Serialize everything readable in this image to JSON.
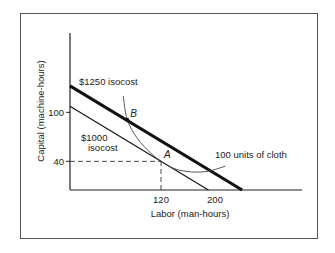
{
  "chart_data": {
    "type": "line",
    "title": "",
    "xlabel": "Labor (man-hours)",
    "ylabel": "Capital (machine-hours)",
    "x_ticks": [
      {
        "value": 120,
        "label": "120"
      },
      {
        "value": 200,
        "label": "200"
      }
    ],
    "y_ticks": [
      {
        "value": 40,
        "label": "40"
      },
      {
        "value": 100,
        "label": "100"
      }
    ],
    "xlim": [
      0,
      280
    ],
    "ylim": [
      0,
      160
    ],
    "grid": false,
    "series": [
      {
        "name": "$1000 isocost",
        "label_lines": [
          "$1000",
          "isocost"
        ],
        "style": "thin",
        "points": [
          [
            0,
            100
          ],
          [
            200,
            0
          ]
        ]
      },
      {
        "name": "$1250 isocost",
        "label_lines": [
          "$1250 isocost"
        ],
        "style": "thick",
        "points": [
          [
            0,
            125
          ],
          [
            250,
            0
          ]
        ]
      },
      {
        "name": "100 units of cloth",
        "label_lines": [
          "100 units of cloth"
        ],
        "style": "curve",
        "points": [
          [
            64,
            120
          ],
          [
            70,
            91
          ],
          [
            85,
            68
          ],
          [
            105,
            50
          ],
          [
            120,
            40
          ],
          [
            140,
            31
          ],
          [
            165,
            27
          ],
          [
            190,
            28
          ],
          [
            215,
            34
          ]
        ]
      }
    ],
    "annotations": [
      {
        "label": "A",
        "x": 120,
        "y": 40,
        "marker": false
      },
      {
        "label": "B",
        "x": 70,
        "y": 91,
        "marker": true
      }
    ],
    "guides": [
      {
        "from": [
          0,
          40
        ],
        "to": [
          120,
          40
        ],
        "style": "dashed"
      },
      {
        "from": [
          120,
          0
        ],
        "to": [
          120,
          40
        ],
        "style": "dashed"
      }
    ]
  }
}
